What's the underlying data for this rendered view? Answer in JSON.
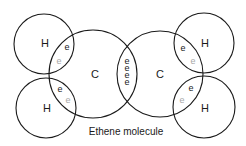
{
  "diagram": {
    "caption": "Ethene molecule",
    "colors": {
      "line": "#1a1a1a",
      "electron_dark": "#1a1a1a",
      "electron_light": "#a8a8a8",
      "background": "#ffffff"
    },
    "atoms": [
      {
        "id": "h-top-left",
        "label": "H",
        "cx": 44,
        "cy": 44,
        "r": 30,
        "lx": 41,
        "ly": 47
      },
      {
        "id": "h-bottom-left",
        "label": "H",
        "cx": 46,
        "cy": 108,
        "r": 30,
        "lx": 43,
        "ly": 112
      },
      {
        "id": "c-left",
        "label": "C",
        "cx": 93,
        "cy": 74,
        "r": 44,
        "lx": 91,
        "ly": 78
      },
      {
        "id": "c-right",
        "label": "C",
        "cx": 160,
        "cy": 74,
        "r": 43,
        "lx": 156,
        "ly": 78
      },
      {
        "id": "h-top-right",
        "label": "H",
        "cx": 204,
        "cy": 43,
        "r": 30,
        "lx": 201,
        "ly": 47
      },
      {
        "id": "h-bottom-right",
        "label": "H",
        "cx": 204,
        "cy": 107,
        "r": 31,
        "lx": 201,
        "ly": 112
      }
    ],
    "electrons": [
      {
        "label": "e",
        "x": 67,
        "y": 50,
        "tone": "dark"
      },
      {
        "label": "e",
        "x": 59,
        "y": 64,
        "tone": "light"
      },
      {
        "label": "e",
        "x": 60,
        "y": 92,
        "tone": "dark"
      },
      {
        "label": "e",
        "x": 68,
        "y": 103,
        "tone": "light"
      },
      {
        "label": "e",
        "x": 127,
        "y": 64,
        "tone": "dark"
      },
      {
        "label": "e",
        "x": 127,
        "y": 71,
        "tone": "dark"
      },
      {
        "label": "e",
        "x": 127,
        "y": 78,
        "tone": "dark"
      },
      {
        "label": "e",
        "x": 127,
        "y": 85,
        "tone": "dark"
      },
      {
        "label": "e",
        "x": 183,
        "y": 51,
        "tone": "dark"
      },
      {
        "label": "e",
        "x": 193,
        "y": 64,
        "tone": "light"
      },
      {
        "label": "e",
        "x": 191,
        "y": 91,
        "tone": "dark"
      },
      {
        "label": "e",
        "x": 182,
        "y": 103,
        "tone": "light"
      }
    ]
  }
}
